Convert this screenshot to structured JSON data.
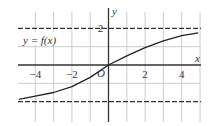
{
  "chart_data": {
    "type": "line",
    "title": "",
    "xlabel": "x",
    "ylabel": "y",
    "origin_label": "O",
    "function_label": "y = f(x)",
    "xlim": [
      -5,
      5
    ],
    "ylim": [
      -3,
      3
    ],
    "grid": true,
    "x_ticks": [
      {
        "value": -4,
        "label": "−4"
      },
      {
        "value": -2,
        "label": "−2"
      },
      {
        "value": 2,
        "label": "2"
      },
      {
        "value": 4,
        "label": "4"
      }
    ],
    "y_ticks": [
      {
        "value": 2,
        "label": "2"
      }
    ],
    "asymptotes": [
      {
        "y": 2,
        "style": "dashed"
      },
      {
        "y": -2,
        "style": "dashed"
      }
    ],
    "series": [
      {
        "name": "f(x)",
        "x": [
          -4.9,
          -4,
          -3,
          -2,
          -1,
          0,
          1,
          2,
          3,
          4,
          4.9
        ],
        "y": [
          -1.88,
          -1.7,
          -1.5,
          -1.18,
          -0.68,
          0,
          0.5,
          0.95,
          1.32,
          1.6,
          1.76
        ]
      }
    ],
    "colors": {
      "curve": "#222222",
      "grid": "#cccccc",
      "axis": "#333333",
      "dashed": "#333333"
    }
  }
}
